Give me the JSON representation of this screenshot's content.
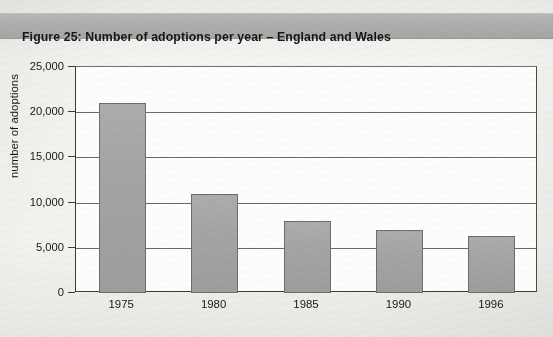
{
  "figure": {
    "title": "Figure 25:  Number of adoptions per year – England and Wales"
  },
  "colors": {
    "bar_fill": "#a8a7a5",
    "bar_stroke": "#6e6d6b",
    "title_band": "#adacaa",
    "plot_background": "#fdfdfc",
    "axis": "#3a3a3a",
    "gridline": "#6a6a6a",
    "page_background": "#f2f1ee"
  },
  "chart_data": {
    "type": "bar",
    "title": "Figure 25:  Number of adoptions per year – England and Wales",
    "categories": [
      "1975",
      "1980",
      "1985",
      "1990",
      "1996"
    ],
    "values": [
      21000,
      11000,
      8000,
      7000,
      6300
    ],
    "xlabel": "",
    "ylabel": "number of adoptions",
    "ylim": [
      0,
      25000
    ],
    "ytick_values": [
      0,
      5000,
      10000,
      15000,
      20000,
      25000
    ],
    "ytick_labels": [
      "0",
      "5,000",
      "10,000",
      "15,000",
      "20,000",
      "25,000"
    ],
    "grid": true,
    "grid_axis": "y",
    "legend": false,
    "legend_position": "none",
    "series": [
      {
        "name": "Number of adoptions",
        "values": [
          21000,
          11000,
          8000,
          7000,
          6300
        ]
      }
    ]
  }
}
